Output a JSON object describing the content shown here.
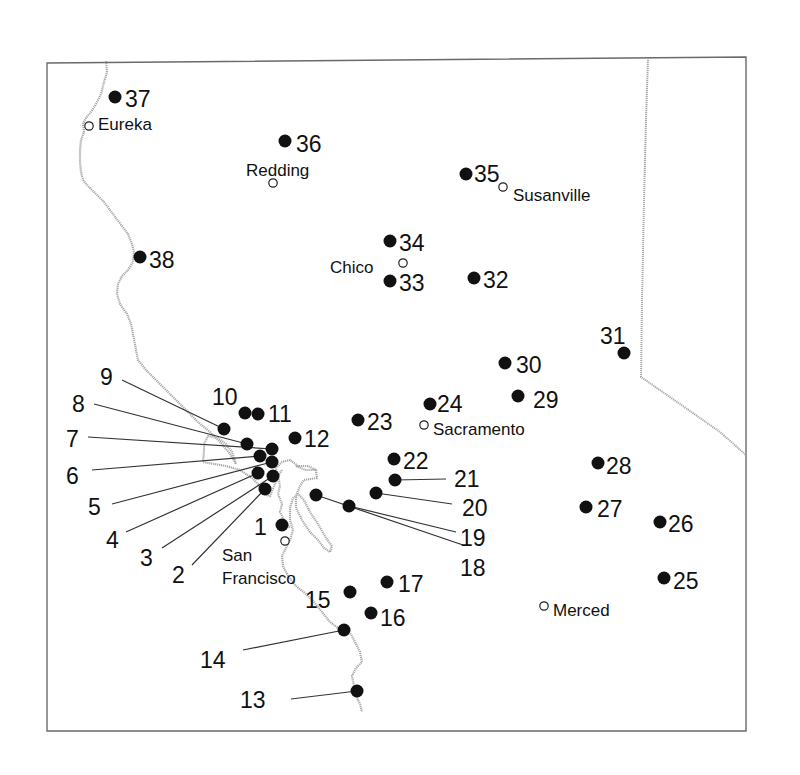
{
  "map": {
    "frame": {
      "x": 47,
      "y": 60,
      "width": 699,
      "height": 671
    },
    "sites": [
      {
        "id": "1",
        "x": 282,
        "y": 525,
        "label": "1",
        "lx": 254,
        "ly": 535
      },
      {
        "id": "2",
        "x": 265,
        "y": 489,
        "label": "2",
        "lx": 172,
        "ly": 583,
        "leader": [
          192,
          565
        ]
      },
      {
        "id": "3",
        "x": 273,
        "y": 476,
        "label": "3",
        "lx": 140,
        "ly": 566,
        "leader": [
          162,
          548
        ]
      },
      {
        "id": "4",
        "x": 258,
        "y": 473,
        "label": "4",
        "lx": 106,
        "ly": 548,
        "leader": [
          126,
          532
        ]
      },
      {
        "id": "5",
        "x": 272,
        "y": 462,
        "label": "5",
        "lx": 88,
        "ly": 515,
        "leader": [
          112,
          504
        ]
      },
      {
        "id": "6",
        "x": 260,
        "y": 456,
        "label": "6",
        "lx": 66,
        "ly": 484,
        "leader": [
          92,
          470
        ]
      },
      {
        "id": "7",
        "x": 272,
        "y": 449,
        "label": "7",
        "lx": 66,
        "ly": 447,
        "leader": [
          88,
          437
        ]
      },
      {
        "id": "8",
        "x": 247,
        "y": 444,
        "label": "8",
        "lx": 72,
        "ly": 412,
        "leader": [
          94,
          404
        ]
      },
      {
        "id": "9",
        "x": 224,
        "y": 429,
        "label": "9",
        "lx": 100,
        "ly": 385,
        "leader": [
          122,
          380
        ]
      },
      {
        "id": "10",
        "x": 245,
        "y": 413,
        "label": "10",
        "lx": 212,
        "ly": 405
      },
      {
        "id": "11",
        "x": 258,
        "y": 414,
        "label": "11",
        "lx": 268,
        "ly": 422
      },
      {
        "id": "12",
        "x": 295,
        "y": 438,
        "label": "12",
        "lx": 304,
        "ly": 447
      },
      {
        "id": "13",
        "x": 357,
        "y": 691,
        "label": "13",
        "lx": 240,
        "ly": 708,
        "leader": [
          291,
          699
        ]
      },
      {
        "id": "14",
        "x": 344,
        "y": 630,
        "label": "14",
        "lx": 200,
        "ly": 668,
        "leader": [
          243,
          650
        ]
      },
      {
        "id": "15",
        "x": 350,
        "y": 592,
        "label": "15",
        "lx": 305,
        "ly": 608
      },
      {
        "id": "16",
        "x": 371,
        "y": 613,
        "label": "16",
        "lx": 380,
        "ly": 626
      },
      {
        "id": "17",
        "x": 387,
        "y": 582,
        "label": "17",
        "lx": 398,
        "ly": 592
      },
      {
        "id": "18",
        "x": 316,
        "y": 495,
        "label": "18",
        "lx": 460,
        "ly": 576,
        "leader": [
          463,
          545
        ]
      },
      {
        "id": "19",
        "x": 349,
        "y": 506,
        "label": "19",
        "lx": 460,
        "ly": 546,
        "leader": [
          456,
          532
        ]
      },
      {
        "id": "20",
        "x": 376,
        "y": 493,
        "label": "20",
        "lx": 462,
        "ly": 516,
        "leader": [
          452,
          504
        ]
      },
      {
        "id": "21",
        "x": 395,
        "y": 480,
        "label": "21",
        "lx": 454,
        "ly": 487,
        "leader": [
          446,
          479
        ]
      },
      {
        "id": "22",
        "x": 394,
        "y": 459,
        "label": "22",
        "lx": 403,
        "ly": 469
      },
      {
        "id": "23",
        "x": 358,
        "y": 420,
        "label": "23",
        "lx": 367,
        "ly": 430
      },
      {
        "id": "24",
        "x": 430,
        "y": 404,
        "label": "24",
        "lx": 437,
        "ly": 412
      },
      {
        "id": "25",
        "x": 664,
        "y": 578,
        "label": "25",
        "lx": 673,
        "ly": 589
      },
      {
        "id": "26",
        "x": 660,
        "y": 522,
        "label": "26",
        "lx": 668,
        "ly": 532
      },
      {
        "id": "27",
        "x": 586,
        "y": 507,
        "label": "27",
        "lx": 597,
        "ly": 517
      },
      {
        "id": "28",
        "x": 598,
        "y": 463,
        "label": "28",
        "lx": 606,
        "ly": 474
      },
      {
        "id": "29",
        "x": 518,
        "y": 396,
        "label": "29",
        "lx": 533,
        "ly": 408
      },
      {
        "id": "30",
        "x": 505,
        "y": 363,
        "label": "30",
        "lx": 516,
        "ly": 373
      },
      {
        "id": "31",
        "x": 624,
        "y": 353,
        "label": "31",
        "lx": 600,
        "ly": 344
      },
      {
        "id": "32",
        "x": 474,
        "y": 278,
        "label": "32",
        "lx": 483,
        "ly": 288
      },
      {
        "id": "33",
        "x": 390,
        "y": 281,
        "label": "33",
        "lx": 399,
        "ly": 291
      },
      {
        "id": "34",
        "x": 390,
        "y": 241,
        "label": "34",
        "lx": 399,
        "ly": 251
      },
      {
        "id": "35",
        "x": 466,
        "y": 174,
        "label": "35",
        "lx": 474,
        "ly": 182
      },
      {
        "id": "36",
        "x": 285,
        "y": 141,
        "label": "36",
        "lx": 296,
        "ly": 152
      },
      {
        "id": "37",
        "x": 115,
        "y": 97,
        "label": "37",
        "lx": 125,
        "ly": 107
      },
      {
        "id": "38",
        "x": 140,
        "y": 257,
        "label": "38",
        "lx": 149,
        "ly": 268
      }
    ],
    "cities": [
      {
        "name": "Eureka",
        "x": 89,
        "y": 126,
        "lx": 98,
        "ly": 126
      },
      {
        "name": "Redding",
        "x": 273,
        "y": 183,
        "lx": 246,
        "ly": 172
      },
      {
        "name": "Susanville",
        "x": 503,
        "y": 187,
        "lx": 513,
        "ly": 197
      },
      {
        "name": "Chico",
        "x": 403,
        "y": 263,
        "lx": 330,
        "ly": 269
      },
      {
        "name": "Sacramento",
        "x": 424,
        "y": 425,
        "lx": 433,
        "ly": 431
      },
      {
        "name": "San",
        "x": 285,
        "y": 541,
        "lx": 222,
        "ly": 557,
        "nodot": true
      },
      {
        "name": "Francisco",
        "x": 285,
        "y": 541,
        "lx": 222,
        "ly": 580,
        "nodot": true
      },
      {
        "name": "Merced",
        "x": 544,
        "y": 606,
        "lx": 553,
        "ly": 612
      }
    ],
    "colors": {
      "site_dot": "#111111",
      "city_dot_fill": "#ffffff",
      "coastline": "#a8a8a8",
      "frame": "#6a6a6a"
    }
  }
}
